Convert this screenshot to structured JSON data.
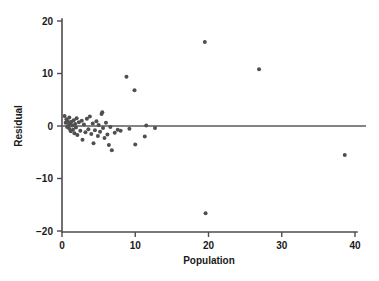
{
  "chart_data": {
    "type": "scatter",
    "title": "",
    "xlabel": "Population",
    "ylabel": "Residual",
    "xlim": [
      0,
      41.5
    ],
    "ylim": [
      -21.5,
      20.8
    ],
    "xticks": [
      0,
      10,
      20,
      30,
      40
    ],
    "xtick_labels": [
      "0",
      "10",
      "20",
      "30",
      "40"
    ],
    "yticks": [
      -20,
      -10,
      0,
      10,
      20
    ],
    "ytick_labels": [
      "−20",
      "−10",
      "0",
      "10",
      "20"
    ],
    "grid": false,
    "legend": null,
    "reference_line": {
      "orientation": "horizontal",
      "y": 0,
      "x_start": 0,
      "x_end": 41.5
    },
    "marker": {
      "shape": "circle",
      "size": 2.0,
      "color": "#4f4f4f"
    },
    "points": [
      {
        "x": 0.35,
        "y": 1.9
      },
      {
        "x": 0.5,
        "y": 0.6
      },
      {
        "x": 0.6,
        "y": 1.3
      },
      {
        "x": 0.7,
        "y": -0.2
      },
      {
        "x": 0.8,
        "y": 0.9
      },
      {
        "x": 0.9,
        "y": 0.2
      },
      {
        "x": 1.0,
        "y": 1.6
      },
      {
        "x": 1.0,
        "y": -0.5
      },
      {
        "x": 1.1,
        "y": 0.5
      },
      {
        "x": 1.2,
        "y": -1.0
      },
      {
        "x": 1.3,
        "y": 0.8
      },
      {
        "x": 1.4,
        "y": 0.1
      },
      {
        "x": 1.5,
        "y": -0.7
      },
      {
        "x": 1.6,
        "y": 1.1
      },
      {
        "x": 1.7,
        "y": -1.4
      },
      {
        "x": 1.8,
        "y": 0.4
      },
      {
        "x": 1.9,
        "y": -0.3
      },
      {
        "x": 2.0,
        "y": 1.5
      },
      {
        "x": 2.1,
        "y": -1.7
      },
      {
        "x": 2.3,
        "y": 0.7
      },
      {
        "x": 2.5,
        "y": -0.9
      },
      {
        "x": 2.7,
        "y": 1.0
      },
      {
        "x": 2.8,
        "y": -2.6
      },
      {
        "x": 3.0,
        "y": 0.3
      },
      {
        "x": 3.2,
        "y": -1.2
      },
      {
        "x": 3.4,
        "y": 1.4
      },
      {
        "x": 3.6,
        "y": -0.6
      },
      {
        "x": 3.8,
        "y": 1.8
      },
      {
        "x": 4.0,
        "y": -1.5
      },
      {
        "x": 4.2,
        "y": 0.5
      },
      {
        "x": 4.3,
        "y": -3.3
      },
      {
        "x": 4.5,
        "y": -0.8
      },
      {
        "x": 4.7,
        "y": 0.9
      },
      {
        "x": 4.9,
        "y": -1.9
      },
      {
        "x": 5.0,
        "y": 0.2
      },
      {
        "x": 5.2,
        "y": -1.1
      },
      {
        "x": 5.4,
        "y": 2.3
      },
      {
        "x": 5.5,
        "y": 2.6
      },
      {
        "x": 5.6,
        "y": -0.4
      },
      {
        "x": 5.8,
        "y": -2.3
      },
      {
        "x": 6.0,
        "y": 0.6
      },
      {
        "x": 6.2,
        "y": -1.6
      },
      {
        "x": 6.4,
        "y": -3.6
      },
      {
        "x": 6.6,
        "y": -0.2
      },
      {
        "x": 6.8,
        "y": -4.6
      },
      {
        "x": 7.2,
        "y": -1.3
      },
      {
        "x": 7.6,
        "y": -0.7
      },
      {
        "x": 8.0,
        "y": -0.9
      },
      {
        "x": 8.8,
        "y": 9.4
      },
      {
        "x": 9.2,
        "y": -0.5
      },
      {
        "x": 9.9,
        "y": 6.8
      },
      {
        "x": 10.0,
        "y": -3.5
      },
      {
        "x": 11.3,
        "y": -2.0
      },
      {
        "x": 11.5,
        "y": 0.1
      },
      {
        "x": 12.7,
        "y": -0.4
      },
      {
        "x": 19.5,
        "y": 16.0
      },
      {
        "x": 19.6,
        "y": -16.6
      },
      {
        "x": 26.9,
        "y": 10.8
      },
      {
        "x": 38.6,
        "y": -5.5
      }
    ]
  }
}
